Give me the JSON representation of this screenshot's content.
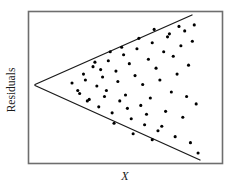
{
  "figure": {
    "type": "residual-plot",
    "background_color": "#ffffff",
    "frame_color": "#6e6e6e",
    "line_color": "#1a1a1a",
    "point_color": "#000000",
    "ylabel": "Residuals",
    "xlabel": "X"
  },
  "chart_data": {
    "type": "scatter",
    "title": "",
    "xlabel": "X",
    "ylabel": "Residuals",
    "xlim": [
      0,
      100
    ],
    "ylim": [
      -50,
      50
    ],
    "grid": false,
    "legend": null,
    "annotations": [
      {
        "name": "upper-envelope-line",
        "type": "line",
        "x": [
          3,
          88
        ],
        "y": [
          0,
          48
        ]
      },
      {
        "name": "lower-envelope-line",
        "type": "line",
        "x": [
          3,
          92
        ],
        "y": [
          0,
          -48
        ]
      }
    ],
    "x": [
      22,
      26,
      28,
      31,
      33,
      35,
      36,
      38,
      40,
      41,
      43,
      45,
      46,
      47,
      49,
      50,
      52,
      53,
      55,
      56,
      58,
      59,
      60,
      62,
      63,
      64,
      66,
      67,
      68,
      70,
      71,
      72,
      74,
      75,
      76,
      77,
      79,
      80,
      81,
      82,
      83,
      84,
      85,
      86,
      87,
      44,
      54,
      64,
      73,
      30,
      48,
      57,
      69,
      78,
      88,
      34,
      61,
      42,
      51,
      65,
      39,
      29,
      37,
      25
    ],
    "y": [
      3,
      -4,
      9,
      -8,
      14,
      1,
      -13,
      7,
      -2,
      18,
      -17,
      11,
      4,
      -9,
      22,
      -5,
      16,
      -21,
      8,
      26,
      -12,
      2,
      -25,
      19,
      -7,
      30,
      13,
      -29,
      5,
      24,
      -16,
      34,
      -3,
      21,
      -33,
      9,
      28,
      -20,
      38,
      -6,
      15,
      -37,
      31,
      42,
      -11,
      -24,
      -31,
      -35,
      36,
      -9,
      27,
      33,
      -26,
      41,
      -44,
      17,
      -18,
      24,
      -14,
      39,
      -6,
      5,
      12,
      -2
    ],
    "point_count": 64
  }
}
